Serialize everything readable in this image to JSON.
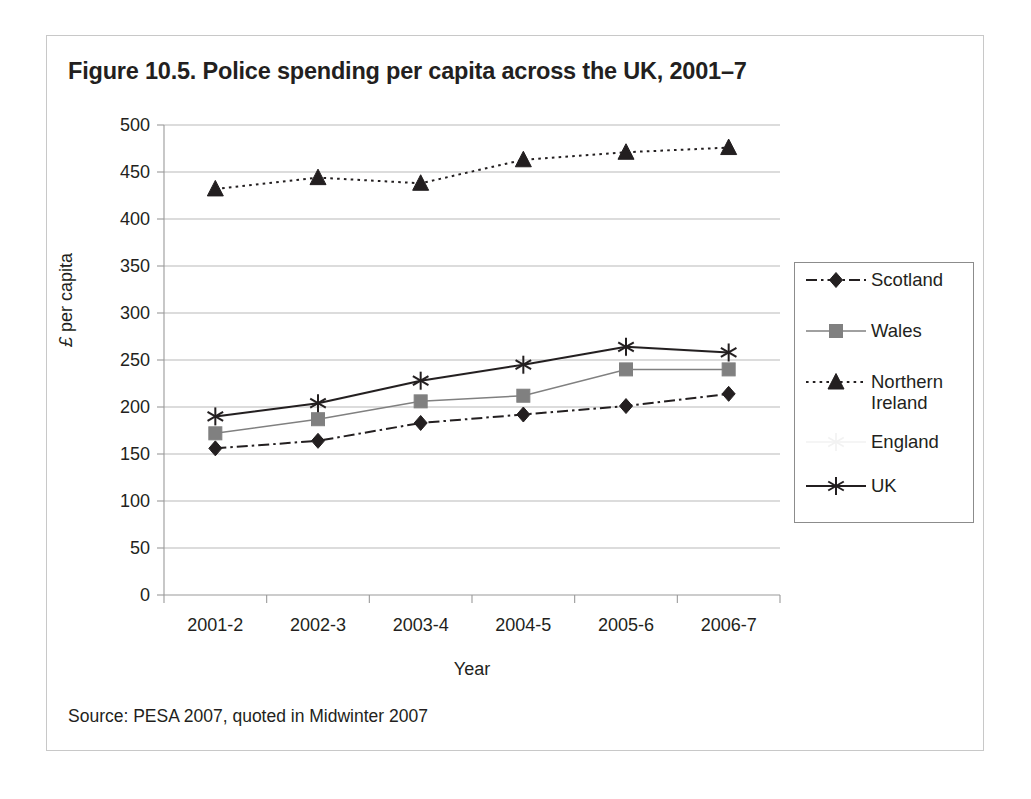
{
  "figure": {
    "title": "Figure 10.5. Police spending per capita across the UK, 2001–7",
    "source": "Source: PESA 2007, quoted in Midwinter 2007"
  },
  "chart_data": {
    "type": "line",
    "title": "Figure 10.5. Police spending per capita across the UK, 2001–7",
    "xlabel": "Year",
    "ylabel": "£ per capita",
    "categories": [
      "2001-2",
      "2002-3",
      "2003-4",
      "2004-5",
      "2005-6",
      "2006-7"
    ],
    "ylim": [
      0,
      500
    ],
    "ytick_step": 50,
    "yticks": [
      "500",
      "450",
      "400",
      "350",
      "300",
      "250",
      "200",
      "150",
      "100",
      "50",
      "0"
    ],
    "grid": "horizontal",
    "legend_position": "right",
    "series": [
      {
        "name": "Scotland",
        "marker": "diamond",
        "line_style": "dash-dot",
        "color": "#231f20",
        "values": [
          156,
          164,
          183,
          192,
          201,
          214
        ]
      },
      {
        "name": "Wales",
        "marker": "square",
        "line_style": "solid",
        "color": "#808080",
        "values": [
          172,
          187,
          206,
          212,
          240,
          240
        ]
      },
      {
        "name": "Northern Ireland",
        "marker": "triangle",
        "line_style": "dotted",
        "color": "#231f20",
        "values": [
          432,
          444,
          438,
          463,
          471,
          476
        ]
      },
      {
        "name": "England",
        "marker": "star",
        "line_style": "solid",
        "color": "#f2f2f2",
        "values": [
          189,
          203,
          227,
          244,
          263,
          257
        ]
      },
      {
        "name": "UK",
        "marker": "asterisk",
        "line_style": "solid",
        "color": "#231f20",
        "values": [
          190,
          204,
          228,
          245,
          264,
          258
        ]
      }
    ]
  },
  "legend": {
    "items": [
      {
        "label": "Scotland"
      },
      {
        "label": "Wales"
      },
      {
        "label": "Northern\nIreland"
      },
      {
        "label": "England"
      },
      {
        "label": "UK"
      }
    ]
  }
}
